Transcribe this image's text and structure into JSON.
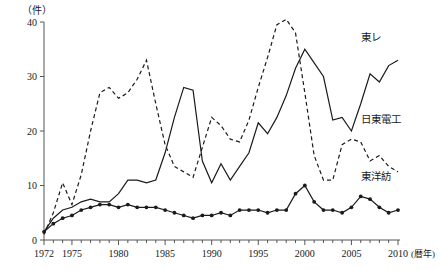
{
  "chart_data": {
    "type": "line",
    "title": "",
    "xlabel": "暦年",
    "ylabel": "件",
    "y_unit_label": "（件）",
    "x_unit_label": "(暦年)",
    "xlim": [
      1972,
      2010
    ],
    "ylim": [
      0,
      40
    ],
    "yticks": [
      0,
      10,
      20,
      30,
      40
    ],
    "ytick_labels": [
      "0",
      "10",
      "20",
      "30",
      "40"
    ],
    "xticks": [
      1972,
      1975,
      1980,
      1985,
      1990,
      1995,
      2000,
      2005,
      2010
    ],
    "xtick_labels": [
      "1972",
      "1975",
      "1980",
      "1985",
      "1990",
      "1995",
      "2000",
      "2005",
      "2010"
    ],
    "minor_xticks_every": 1,
    "grid": false,
    "legend_position": "inline-right",
    "x": [
      1972,
      1973,
      1974,
      1975,
      1976,
      1977,
      1978,
      1979,
      1980,
      1981,
      1982,
      1983,
      1984,
      1985,
      1986,
      1987,
      1988,
      1989,
      1990,
      1991,
      1992,
      1993,
      1994,
      1995,
      1996,
      1997,
      1998,
      1999,
      2000,
      2001,
      2002,
      2003,
      2004,
      2005,
      2006,
      2007,
      2008,
      2009,
      2010
    ],
    "series": [
      {
        "name": "東レ",
        "style": "solid",
        "marker": "none",
        "label_x": 2006,
        "label_y": 36.5,
        "values": [
          1.5,
          4.0,
          5.5,
          6.0,
          7.0,
          7.5,
          7.0,
          7.0,
          8.5,
          11.0,
          11.0,
          10.5,
          11.0,
          16.0,
          22.5,
          28.0,
          27.5,
          14.5,
          10.5,
          14.0,
          11.0,
          13.5,
          16.0,
          21.5,
          19.5,
          22.5,
          26.5,
          31.5,
          35.0,
          32.5,
          30.0,
          22.0,
          22.5,
          20.0,
          25.0,
          30.5,
          29.0,
          32.0,
          33.0
        ]
      },
      {
        "name": "日東電工",
        "style": "dashed",
        "marker": "none",
        "label_x": 2006,
        "label_y": 21.5,
        "values": [
          1.0,
          5.0,
          10.5,
          6.5,
          12.0,
          20.0,
          27.0,
          28.0,
          26.0,
          27.0,
          29.5,
          33.0,
          25.0,
          17.5,
          13.5,
          12.5,
          11.5,
          17.0,
          22.5,
          21.0,
          18.5,
          18.0,
          22.0,
          28.0,
          33.5,
          39.5,
          40.5,
          38.0,
          27.0,
          15.5,
          11.0,
          11.0,
          17.5,
          18.5,
          18.0,
          14.5,
          15.5,
          13.5,
          12.5
        ]
      },
      {
        "name": "東洋紡",
        "style": "solid",
        "marker": "circle",
        "label_x": 2006,
        "label_y": 11.0,
        "values": [
          1.5,
          3.0,
          4.0,
          4.5,
          5.5,
          6.0,
          6.5,
          6.5,
          6.0,
          6.5,
          6.0,
          6.0,
          6.0,
          5.5,
          5.0,
          4.5,
          4.0,
          4.5,
          4.5,
          5.0,
          4.5,
          5.5,
          5.5,
          5.5,
          5.0,
          5.5,
          5.5,
          8.5,
          10.0,
          7.0,
          5.5,
          5.5,
          5.0,
          6.0,
          8.0,
          7.5,
          6.0,
          5.0,
          5.5
        ]
      }
    ]
  }
}
